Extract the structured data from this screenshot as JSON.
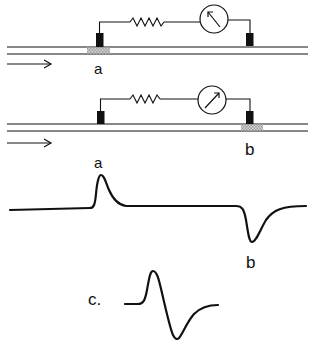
{
  "figure": {
    "colors": {
      "ink": "#111111",
      "background": "#ffffff",
      "shading": "#b8b8b8"
    },
    "panel_top": {
      "electrode_left_label": "a",
      "active_region": "a",
      "galvanometer_deflection": "left",
      "direction_arrow": "right"
    },
    "panel_middle": {
      "electrode_right_label": "b",
      "active_region": "b",
      "galvanometer_deflection": "right",
      "direction_arrow": "right"
    },
    "trace_ab": {
      "peak_label": "a",
      "trough_label": "b"
    },
    "trace_c": {
      "label": "c."
    }
  }
}
